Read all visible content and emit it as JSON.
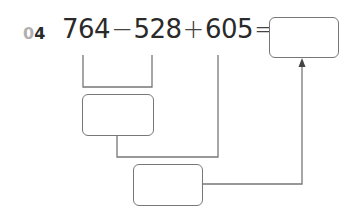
{
  "problem": {
    "number_prefix": "0",
    "number_digit": "4",
    "terms": [
      "764",
      "528",
      "605"
    ],
    "operators": [
      "−",
      "+",
      "="
    ]
  },
  "boxes": {
    "answer": "",
    "step1_result": "",
    "step2_result": ""
  },
  "colors": {
    "text": "#2a2a2a",
    "number_prefix": "#b0b0b0",
    "lines": "#777777"
  }
}
